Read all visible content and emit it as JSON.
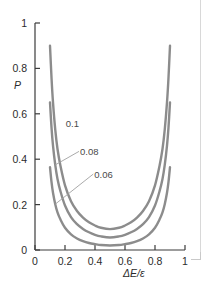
{
  "chart_data": {
    "type": "line",
    "title": "",
    "subtitle": "",
    "xlabel": "ΔE/ε",
    "ylabel": "P",
    "xlim": [
      0,
      1
    ],
    "ylim": [
      0,
      1
    ],
    "grid": false,
    "legend_position": "inline-labels",
    "x_ticks": [
      "0",
      "0.2",
      "0.4",
      "0.6",
      "0.8",
      "1"
    ],
    "x_tick_values": [
      0,
      0.2,
      0.4,
      0.6,
      0.8,
      1
    ],
    "y_ticks": [
      "0",
      "0.2",
      "0.4",
      "0.6",
      "0.8",
      "1"
    ],
    "y_tick_values": [
      0,
      0.2,
      0.4,
      0.6,
      0.8,
      1
    ],
    "series": [
      {
        "name": "0.1",
        "label": "0.1",
        "color": "#8c8c8c",
        "x": [
          0.1,
          0.11,
          0.12,
          0.135,
          0.15,
          0.17,
          0.2,
          0.24,
          0.28,
          0.32,
          0.36,
          0.4,
          0.44,
          0.5,
          0.56,
          0.6,
          0.64,
          0.68,
          0.72,
          0.76,
          0.8,
          0.83,
          0.85,
          0.865,
          0.88,
          0.89,
          0.9
        ],
        "y": [
          0.9,
          0.76,
          0.65,
          0.53,
          0.445,
          0.37,
          0.285,
          0.215,
          0.172,
          0.143,
          0.122,
          0.108,
          0.098,
          0.092,
          0.098,
          0.108,
          0.122,
          0.143,
          0.172,
          0.215,
          0.285,
          0.37,
          0.445,
          0.53,
          0.65,
          0.76,
          0.9
        ]
      },
      {
        "name": "0.08",
        "label": "0.08",
        "color": "#8c8c8c",
        "x": [
          0.1,
          0.11,
          0.12,
          0.135,
          0.15,
          0.17,
          0.2,
          0.24,
          0.28,
          0.32,
          0.36,
          0.4,
          0.44,
          0.5,
          0.56,
          0.6,
          0.64,
          0.68,
          0.72,
          0.76,
          0.8,
          0.83,
          0.85,
          0.865,
          0.88,
          0.89,
          0.9
        ],
        "y": [
          0.65,
          0.54,
          0.46,
          0.375,
          0.313,
          0.258,
          0.196,
          0.145,
          0.114,
          0.093,
          0.078,
          0.067,
          0.06,
          0.055,
          0.06,
          0.067,
          0.078,
          0.093,
          0.114,
          0.145,
          0.196,
          0.258,
          0.313,
          0.375,
          0.46,
          0.54,
          0.65
        ]
      },
      {
        "name": "0.06",
        "label": "0.06",
        "color": "#8c8c8c",
        "x": [
          0.1,
          0.11,
          0.12,
          0.135,
          0.15,
          0.17,
          0.2,
          0.24,
          0.28,
          0.32,
          0.36,
          0.4,
          0.44,
          0.5,
          0.56,
          0.6,
          0.64,
          0.68,
          0.72,
          0.76,
          0.8,
          0.83,
          0.85,
          0.865,
          0.88,
          0.89,
          0.9
        ],
        "y": [
          0.365,
          0.3,
          0.252,
          0.202,
          0.166,
          0.134,
          0.098,
          0.069,
          0.051,
          0.039,
          0.031,
          0.026,
          0.022,
          0.02,
          0.022,
          0.026,
          0.031,
          0.039,
          0.051,
          0.069,
          0.098,
          0.134,
          0.166,
          0.202,
          0.252,
          0.3,
          0.365
        ]
      }
    ],
    "annotations": [
      {
        "text": "0.1",
        "x": 0.205,
        "y": 0.555
      },
      {
        "text": "0.08",
        "x": 0.3,
        "y": 0.43
      },
      {
        "text": "0.06",
        "x": 0.395,
        "y": 0.33
      }
    ],
    "colors": {
      "curve": "#8c8c8c",
      "axis": "#3b3b3b",
      "text": "#2b2b2b",
      "label_text": "#4a4a4a",
      "background": "#ffffff"
    }
  }
}
